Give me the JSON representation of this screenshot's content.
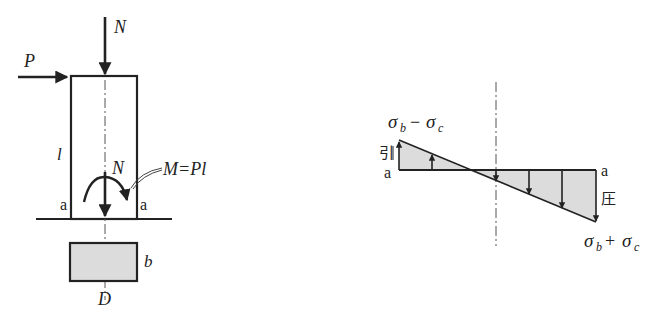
{
  "figure": {
    "colors": {
      "line": "#222222",
      "fill": "#d9d9d9"
    }
  },
  "column_view": {
    "labels": {
      "N_top": "N",
      "P": "P",
      "l": "l",
      "N_inner": "N",
      "moment": "M=Pl",
      "a_left": "a",
      "a_right": "a",
      "b": "b",
      "D": "D"
    }
  },
  "stress_diagram": {
    "labels": {
      "top_stress": "σ",
      "top_sub_b": "b",
      "top_op": "−",
      "top_sigma2": "σ",
      "top_sub_c": "c",
      "tension": "引",
      "a_left": "a",
      "a_right": "a",
      "compression": "圧",
      "bottom_stress": "σ",
      "bottom_sub_b": "b",
      "bottom_op": "+",
      "bottom_sigma2": "σ",
      "bottom_sub_c": "c"
    }
  }
}
